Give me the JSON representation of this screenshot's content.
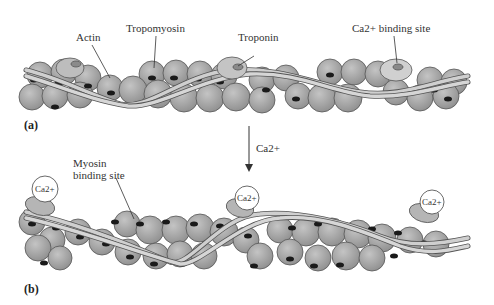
{
  "figure": {
    "panel_a": {
      "tag": "(a)",
      "labels": {
        "actin": "Actin",
        "tropomyosin": "Tropomyosin",
        "troponin": "Troponin",
        "ca_binding_site": "Ca2+ binding site"
      }
    },
    "transition": {
      "arrow_label": "Ca2+"
    },
    "panel_b": {
      "tag": "(b)",
      "labels": {
        "myosin_binding_site_line1": "Myosin",
        "myosin_binding_site_line2": "binding site"
      },
      "ca_ion_label": "Ca2+"
    }
  },
  "colors": {
    "actin_fill": "#a9a9a9",
    "actin_stroke": "#555555",
    "site_dark": "#1a1a1a",
    "tropomyosin_fill": "#c8c8c8",
    "troponin_fill": "#b5b5b5",
    "text": "#333333"
  }
}
